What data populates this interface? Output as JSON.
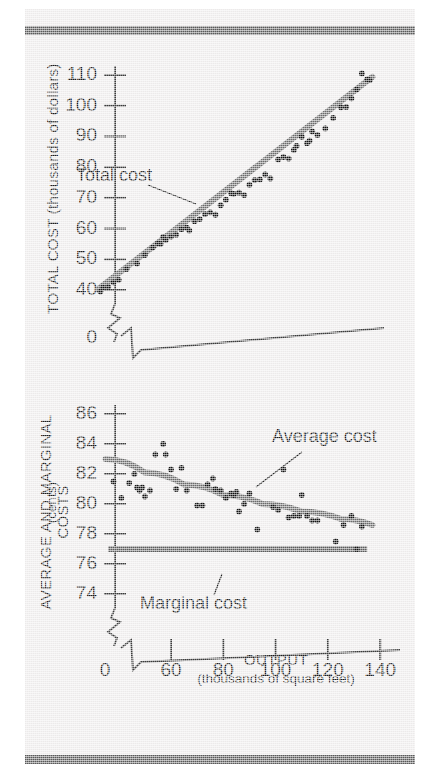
{
  "figure": {
    "background_color": "#eceaea",
    "rule_color": "#595959",
    "trend_line_color": "#6a6a6a",
    "dot_color": "#111111"
  },
  "chart_data": [
    {
      "id": "total-cost",
      "type": "scatter",
      "title": "",
      "xlabel": "OUTPUT",
      "xlabel_sub": "(thousands of square feet)",
      "ylabel": "TOTAL COST (thousands of dollars)",
      "xlim": [
        0,
        145
      ],
      "ylim": [
        38,
        113
      ],
      "xticks": [],
      "yticks": [
        40,
        50,
        60,
        70,
        80,
        90,
        100,
        110
      ],
      "ytick_labels": [
        "40",
        "50",
        "60",
        "70",
        "80",
        "90",
        "100",
        "110"
      ],
      "axis_origin_label": "0",
      "axis_break": true,
      "grid": false,
      "annotations": [
        {
          "text": "Total cost",
          "x": 62,
          "y": 88
        }
      ],
      "series": [
        {
          "name": "Total cost",
          "type": "scatter",
          "points": [
            [
              33,
              39.5
            ],
            [
              34,
              40.8
            ],
            [
              36,
              41.0
            ],
            [
              38,
              42.5
            ],
            [
              40,
              43.3
            ],
            [
              43,
              46.8
            ],
            [
              47,
              48.6
            ],
            [
              50,
              51.4
            ],
            [
              53,
              53.8
            ],
            [
              55,
              55.2
            ],
            [
              56,
              55.0
            ],
            [
              57,
              57.3
            ],
            [
              58,
              56.3
            ],
            [
              60,
              57.4
            ],
            [
              62,
              58.0
            ],
            [
              64,
              59.8
            ],
            [
              66,
              60.3
            ],
            [
              67,
              59.4
            ],
            [
              69,
              62.4
            ],
            [
              71,
              63.1
            ],
            [
              73,
              64.7
            ],
            [
              75,
              65.3
            ],
            [
              77,
              64.5
            ],
            [
              79,
              67.6
            ],
            [
              81,
              69.4
            ],
            [
              83,
              71.5
            ],
            [
              84,
              71.3
            ],
            [
              86,
              71.7
            ],
            [
              88,
              70.9
            ],
            [
              90,
              74.3
            ],
            [
              92,
              75.8
            ],
            [
              94,
              76.0
            ],
            [
              96,
              77.6
            ],
            [
              98,
              76.3
            ],
            [
              101,
              82.5
            ],
            [
              103,
              83.3
            ],
            [
              105,
              82.8
            ],
            [
              107,
              85.6
            ],
            [
              108,
              86.9
            ],
            [
              110,
              89.9
            ],
            [
              112,
              87.8
            ],
            [
              113,
              88.6
            ],
            [
              114,
              91.6
            ],
            [
              116,
              90.5
            ],
            [
              119,
              92.6
            ],
            [
              122,
              96.0
            ],
            [
              125,
              99.5
            ],
            [
              127,
              99.6
            ],
            [
              129,
              102.4
            ],
            [
              131,
              105.3
            ],
            [
              133,
              110.5
            ],
            [
              135,
              108.6
            ],
            [
              136,
              108.3
            ]
          ]
        },
        {
          "name": "Total cost trend line",
          "type": "line",
          "points": [
            [
              32,
              40.2
            ],
            [
              137,
              109.4
            ]
          ]
        }
      ]
    },
    {
      "id": "average-marginal-cost",
      "type": "scatter",
      "title": "",
      "xlabel": "OUTPUT",
      "xlabel_sub": "(thousands of square feet)",
      "ylabel": "AVERAGE AND MARGINAL COSTS",
      "ylabel_sub": "(cents)",
      "xlim": [
        0,
        145
      ],
      "ylim": [
        73,
        86.8
      ],
      "xticks": [
        0,
        60,
        80,
        100,
        120,
        140
      ],
      "xtick_labels": [
        "0",
        "60",
        "80",
        "100",
        "120",
        "140"
      ],
      "yticks": [
        74,
        76,
        78,
        80,
        82,
        84,
        86
      ],
      "ytick_labels": [
        "74",
        "76",
        "78",
        "80",
        "82",
        "84",
        "86"
      ],
      "axis_origin_label": "0",
      "axis_break": true,
      "grid": false,
      "annotations": [
        {
          "text": "Average cost",
          "x": 104,
          "y": 84.0
        },
        {
          "text": "Marginal cost",
          "x": 62,
          "y": 74.6
        }
      ],
      "series": [
        {
          "name": "Average cost",
          "type": "scatter",
          "points": [
            [
              38,
              81.5
            ],
            [
              41,
              80.4
            ],
            [
              44,
              81.4
            ],
            [
              46,
              82.0
            ],
            [
              47,
              81.1
            ],
            [
              48,
              80.9
            ],
            [
              49,
              81.1
            ],
            [
              50,
              80.5
            ],
            [
              52,
              80.9
            ],
            [
              54,
              83.3
            ],
            [
              57,
              84.0
            ],
            [
              58,
              83.3
            ],
            [
              60,
              82.3
            ],
            [
              62,
              81.0
            ],
            [
              64,
              82.4
            ],
            [
              66,
              80.9
            ],
            [
              70,
              79.9
            ],
            [
              72,
              79.9
            ],
            [
              74,
              81.3
            ],
            [
              76,
              81.7
            ],
            [
              77,
              81.0
            ],
            [
              79,
              80.9
            ],
            [
              81,
              80.4
            ],
            [
              83,
              80.7
            ],
            [
              84,
              80.6
            ],
            [
              85,
              80.8
            ],
            [
              86,
              79.5
            ],
            [
              88,
              80.0
            ],
            [
              90,
              80.7
            ],
            [
              93,
              78.3
            ],
            [
              99,
              79.8
            ],
            [
              101,
              79.6
            ],
            [
              103,
              82.3
            ],
            [
              105,
              79.1
            ],
            [
              107,
              79.2
            ],
            [
              109,
              79.2
            ],
            [
              110,
              80.6
            ],
            [
              112,
              79.2
            ],
            [
              114,
              78.9
            ],
            [
              116,
              78.9
            ],
            [
              123,
              77.5
            ],
            [
              126,
              78.6
            ],
            [
              129,
              79.2
            ],
            [
              131,
              77.0
            ],
            [
              133,
              78.5
            ]
          ]
        },
        {
          "name": "Average cost trend line",
          "type": "line",
          "points": [
            [
              35,
              83.0
            ],
            [
              50,
              82.1
            ],
            [
              65,
              81.3
            ],
            [
              80,
              80.6
            ],
            [
              95,
              80.0
            ],
            [
              110,
              79.5
            ],
            [
              125,
              79.0
            ],
            [
              137,
              78.6
            ]
          ]
        },
        {
          "name": "Marginal cost",
          "type": "line",
          "points": [
            [
              36,
              77.0
            ],
            [
              135,
              77.0
            ]
          ]
        }
      ]
    }
  ]
}
